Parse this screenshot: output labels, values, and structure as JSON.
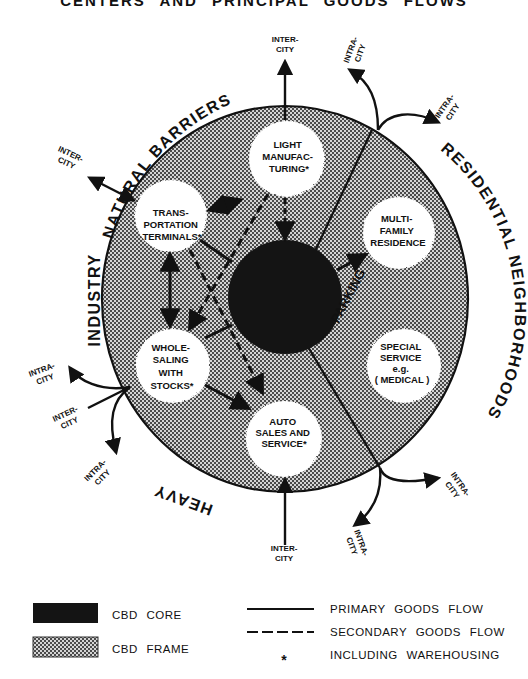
{
  "title": "CENTERS AND PRINCIPAL GOODS FLOWS",
  "colors": {
    "core": "#141414",
    "frame_dot": "#555555",
    "frame_bg": "#cfcfcf",
    "ink": "#111111",
    "paper": "#ffffff"
  },
  "surrounding_areas": {
    "top": "NATURAL BARRIERS",
    "left": "INDUSTRY",
    "bottom_left": "HEAVY",
    "right": "RESIDENTIAL NEIGHBORHOODS",
    "inner": "PARKING"
  },
  "nodes": {
    "light_manufacturing": [
      "LIGHT",
      "MANUFAC-",
      "TURING*"
    ],
    "transportation_terminals": [
      "TRANS-",
      "PORTATION",
      "TERMINALS*"
    ],
    "wholesaling": [
      "WHOLE-",
      "SALING",
      "WITH",
      "STOCKS*"
    ],
    "auto_sales": [
      "AUTO",
      "SALES AND",
      "SERVICE*"
    ],
    "multi_family": [
      "MULTI-",
      "FAMILY",
      "RESIDENCE"
    ],
    "special_service": [
      "SPECIAL",
      "SERVICE",
      "e.g.",
      "( MEDICAL )"
    ]
  },
  "external_flows": {
    "top_inter": [
      "INTER-",
      "CITY"
    ],
    "top_right_intra": [
      "INTRA-",
      "CITY"
    ],
    "right_intra": [
      "INTRA-",
      "CITY"
    ],
    "left_inter": [
      "INTER-",
      "CITY"
    ],
    "left_intra": [
      "INTRA-",
      "CITY"
    ],
    "left_inter_2": [
      "INTER-",
      "CITY"
    ],
    "bottom_left_intra": [
      "INTRA-",
      "CITY"
    ],
    "bottom_inter": [
      "INTER-",
      "CITY"
    ],
    "bottom_right_intra": [
      "INTRA-",
      "CITY"
    ],
    "bottom_right_intra_2": [
      "INTRA-",
      "CITY"
    ]
  },
  "legend": {
    "core": "CBD CORE",
    "frame": "CBD FRAME",
    "primary": "PRIMARY GOODS FLOW",
    "secondary": "SECONDARY GOODS FLOW",
    "asterisk_symbol": "*",
    "asterisk": "INCLUDING WAREHOUSING"
  }
}
